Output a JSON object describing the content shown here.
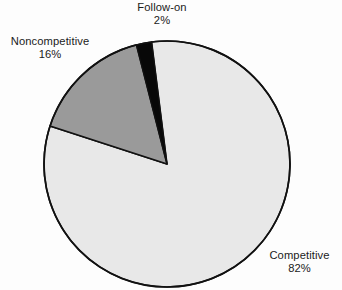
{
  "chart_data": {
    "type": "pie",
    "title": "",
    "subtitle": "",
    "xlabel": "",
    "ylabel": "",
    "legend_position": "none",
    "grid": false,
    "value_unit": "%",
    "start_angle_deg": -7.2,
    "direction": "clockwise",
    "categories": [
      "Competitive",
      "Noncompetitive",
      "Follow-on"
    ],
    "values": [
      82,
      16,
      2
    ],
    "labels": [
      "82%",
      "16%",
      "2%"
    ],
    "colors": [
      "#e8e8e8",
      "#9a9a9a",
      "#080808"
    ],
    "slices": [
      {
        "name": "Competitive",
        "value": 82,
        "value_label": "82%",
        "color": "#e8e8e8",
        "start_angle_deg": -7.2,
        "end_angle_deg": 288.0
      },
      {
        "name": "Noncompetitive",
        "value": 16,
        "value_label": "16%",
        "color": "#9a9a9a",
        "start_angle_deg": 288.0,
        "end_angle_deg": 345.6
      },
      {
        "name": "Follow-on",
        "value": 2,
        "value_label": "2%",
        "color": "#080808",
        "start_angle_deg": 345.6,
        "end_angle_deg": 352.8
      }
    ],
    "outline_color": "#111111",
    "background": "#fdfdfd"
  },
  "labels": {
    "followon": {
      "name": "Follow-on",
      "value": "2%"
    },
    "noncompetitive": {
      "name": "Noncompetitive",
      "value": "16%"
    },
    "competitive": {
      "name": "Competitive",
      "value": "82%"
    }
  }
}
